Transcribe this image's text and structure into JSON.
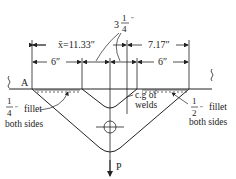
{
  "diagram": {
    "dimensions": {
      "xbar": "x̄=11.33″",
      "right_total": "7.17″",
      "left_leg": "6″",
      "right_leg": "6″",
      "gap_whole": "3",
      "gap_num": "1",
      "gap_den": "4",
      "gap_unit": "″"
    },
    "labels": {
      "support": "A",
      "load": "P",
      "cg_line1": "c.g of",
      "cg_line2": "welds"
    },
    "left_weld": {
      "num": "1",
      "den": "4",
      "unit": "″",
      "text1": "fillet",
      "text2": "both sides"
    },
    "right_weld": {
      "num": "1",
      "den": "2",
      "unit": "″",
      "text1": "fillet",
      "text2": "both sides"
    },
    "colors": {
      "line": "#222222",
      "background": "#ffffff"
    }
  }
}
